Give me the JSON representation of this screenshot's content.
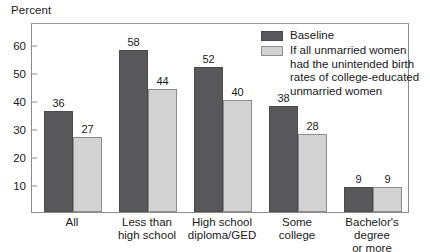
{
  "chart_data": {
    "type": "bar",
    "title": "",
    "xlabel": "",
    "ylabel": "Percent",
    "ylim": [
      0,
      68
    ],
    "yticks": [
      10,
      20,
      30,
      40,
      50,
      60
    ],
    "grid": false,
    "legend_position": "top-right-inside",
    "categories": [
      "All",
      "Less than\nhigh school",
      "High school\ndiploma/GED",
      "Some\ncollege",
      "Bachelor's degree\nor more"
    ],
    "series": [
      {
        "name": "Baseline",
        "color": "#58585a",
        "values": [
          36,
          58,
          52,
          38,
          9
        ]
      },
      {
        "name": "If all unmarried women\nhad the unintended birth\nrates of college-educated\nunmarried women",
        "color": "#d2d2d2",
        "values": [
          27,
          44,
          40,
          28,
          9
        ]
      }
    ]
  },
  "colors": {
    "baseline": "#58585a",
    "counterfactual": "#d2d2d2",
    "frame": "#8c8c8c",
    "text": "#1a1a1a"
  }
}
